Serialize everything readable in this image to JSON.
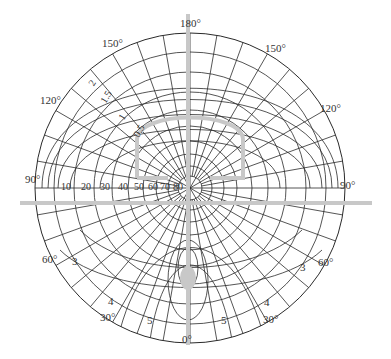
{
  "diagram": {
    "type": "polar-wave-diagram",
    "angle_labels": {
      "top": "180°",
      "upper_left": "150°",
      "upper_right": "150°",
      "left_upper": "120°",
      "right_upper": "120°",
      "left_mid": "90°",
      "right_mid": "90°",
      "left_lower": "60°",
      "right_lower": "60°",
      "bottom_left": "30°",
      "bottom_right": "30°",
      "bottom": "0°"
    },
    "radial_labels": [
      "10",
      "20",
      "30",
      "40",
      "50",
      "60",
      "70",
      "80"
    ],
    "curve_labels_upper": [
      "2",
      "1.5",
      "1",
      "0.5"
    ],
    "curve_labels_lower": {
      "left_3": "3",
      "right_3": "3",
      "left_4": "4",
      "right_4": "4",
      "left_5": "5",
      "right_5": "5"
    },
    "colors": {
      "grid": "#2a2a2a",
      "highlight": "#c8c8c8",
      "text": "#333333"
    }
  }
}
